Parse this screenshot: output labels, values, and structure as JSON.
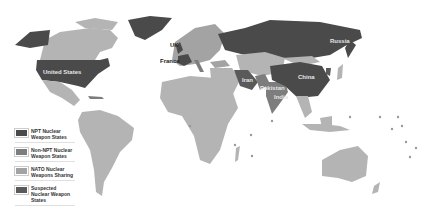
{
  "map": {
    "title": "World map of nuclear weapon states",
    "colors": {
      "background": "#ffffff",
      "npt": "#4a4a4a",
      "non_npt": "#7d7d7d",
      "nato_sharing": "#a3a3a3",
      "suspected": "#5a5a5a",
      "other": "#b4b4b4"
    },
    "labels": [
      {
        "name": "Russia",
        "x": 330,
        "y": 40,
        "style": "light"
      },
      {
        "name": "United States",
        "x": 45,
        "y": 72,
        "style": "light"
      },
      {
        "name": "UK",
        "x": 172,
        "y": 44,
        "style": "dark"
      },
      {
        "name": "France",
        "x": 164,
        "y": 60,
        "style": "dark"
      },
      {
        "name": "Iran",
        "x": 243,
        "y": 79,
        "style": "light"
      },
      {
        "name": "China",
        "x": 300,
        "y": 76,
        "style": "light"
      },
      {
        "name": "Pakistan",
        "x": 265,
        "y": 86,
        "style": "light"
      },
      {
        "name": "India",
        "x": 277,
        "y": 95,
        "style": "light"
      }
    ]
  },
  "legend": {
    "items": [
      {
        "label": "NPT Nuclear Weapon States",
        "color": "#4a4a4a"
      },
      {
        "label": "Non-NPT Nuclear Weapon States",
        "color": "#7d7d7d"
      },
      {
        "label": "NATO Nuclear Weapons Sharing",
        "color": "#a3a3a3"
      },
      {
        "label": "Suspected Nuclear Weapon States",
        "color": "#5a5a5a"
      }
    ]
  }
}
